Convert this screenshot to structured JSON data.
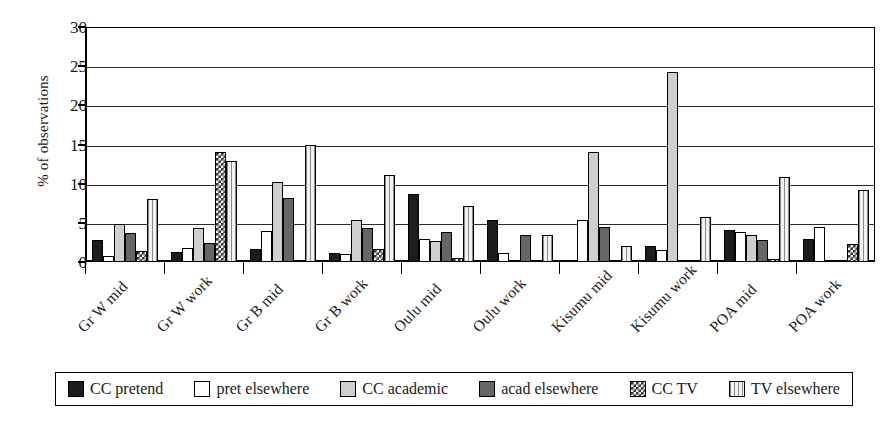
{
  "chart_data": {
    "type": "bar",
    "title": "",
    "xlabel": "",
    "ylabel": "% of observations",
    "ylim": [
      0,
      30
    ],
    "ytick_values": [
      0,
      5,
      10,
      15,
      20,
      25,
      30
    ],
    "ytick_labels": [
      "0",
      "5",
      "10",
      "15",
      "20",
      "25",
      "30"
    ],
    "grid": true,
    "legend_position": "bottom",
    "categories": [
      "Gr W mid",
      "Gr W work",
      "Gr B mid",
      "Gr B work",
      "Oulu mid",
      "Oulu work",
      "Kisumu mid",
      "Kisumu work",
      "POA mid",
      "POA work"
    ],
    "series": [
      {
        "name": "CC pretend",
        "fill": "solid-black",
        "color": "#1c1c1c",
        "values": [
          2.8,
          1.3,
          1.7,
          1.1,
          8.7,
          5.4,
          0.0,
          2.1,
          4.1,
          2.9
        ]
      },
      {
        "name": "pret elsewhere",
        "fill": "white",
        "color": "#ffffff",
        "values": [
          0.8,
          1.8,
          4.0,
          1.0,
          3.0,
          1.1,
          5.4,
          1.5,
          3.8,
          4.5
        ]
      },
      {
        "name": "CC academic",
        "fill": "light-gray",
        "color": "#cfcfcf",
        "values": [
          4.8,
          4.3,
          10.2,
          5.3,
          2.7,
          0.0,
          14.1,
          24.3,
          3.4,
          0.0
        ]
      },
      {
        "name": "acad elsewhere",
        "fill": "dark-gray",
        "color": "#666666",
        "values": [
          3.7,
          2.4,
          8.2,
          4.3,
          3.8,
          3.5,
          4.5,
          0.3,
          2.8,
          0.0
        ]
      },
      {
        "name": "CC TV",
        "fill": "checkerboard",
        "color": "#3a3a3a",
        "values": [
          1.4,
          14.1,
          0.0,
          1.6,
          0.5,
          0.0,
          0.0,
          0.0,
          0.4,
          2.3
        ]
      },
      {
        "name": "TV elsewhere",
        "fill": "vertical-stripes",
        "color": "#efefef",
        "values": [
          8.0,
          12.9,
          14.9,
          11.1,
          7.2,
          3.5,
          2.0,
          5.8,
          10.8,
          9.2
        ]
      }
    ]
  }
}
